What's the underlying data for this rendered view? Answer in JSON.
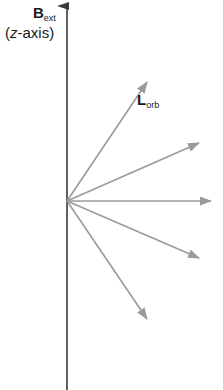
{
  "diagram": {
    "axis": {
      "label_main": "B",
      "label_sub": "ext",
      "label_paren_open": "(",
      "label_axis_var": "z",
      "label_axis_rest": "-axis)",
      "color": "#3a3a3a"
    },
    "vector_label": {
      "main": "L",
      "sub": "orb"
    },
    "origin": {
      "x": 67,
      "y": 201
    },
    "vectors": [
      {
        "name": "vector-1",
        "tip_x": 147,
        "tip_y": 82
      },
      {
        "name": "vector-2",
        "tip_x": 199,
        "tip_y": 143
      },
      {
        "name": "vector-3",
        "tip_x": 211,
        "tip_y": 201
      },
      {
        "name": "vector-4",
        "tip_x": 199,
        "tip_y": 258
      },
      {
        "name": "vector-5",
        "tip_x": 147,
        "tip_y": 319
      }
    ],
    "vector_color": "#9a9a9a"
  }
}
